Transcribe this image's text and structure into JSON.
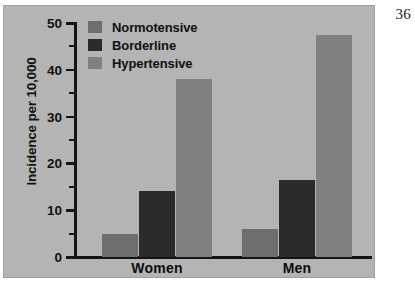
{
  "page_number": "36",
  "chart_data": {
    "type": "bar",
    "title": "",
    "xlabel": "",
    "ylabel": "Incidence per 10,000",
    "categories": [
      "Women",
      "Men"
    ],
    "series": [
      {
        "name": "Normotensive",
        "color": "#6e6e6e",
        "values": [
          5.0,
          6.0
        ]
      },
      {
        "name": "Borderline",
        "color": "#2b2b2b",
        "values": [
          14.0,
          16.4
        ]
      },
      {
        "name": "Hypertensive",
        "color": "#808080",
        "values": [
          38.0,
          47.5
        ]
      }
    ],
    "ylim": [
      0,
      50
    ],
    "y_ticks_major": [
      0,
      10,
      20,
      30,
      40,
      50
    ],
    "y_tick_labels": [
      "0",
      "10",
      "20",
      "30",
      "40",
      "50"
    ],
    "y_ticks_minor": [
      5,
      15,
      25,
      35,
      45
    ],
    "grid": false,
    "legend_position": "top-left",
    "background_color": "#b4b4b4",
    "axis_color": "#141414"
  }
}
